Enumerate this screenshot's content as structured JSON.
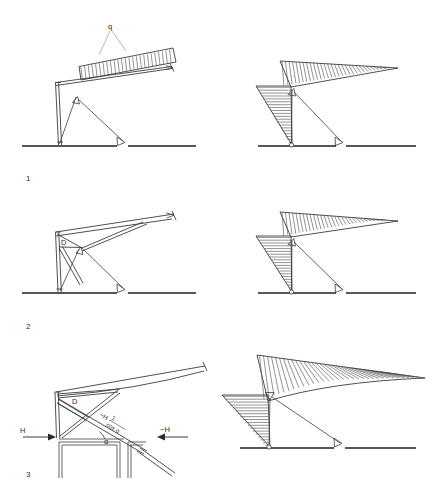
{
  "figure": {
    "rows": [
      {
        "number": "1",
        "left_caption": "Straight cantilever beam with uniform distributed load q, tension tie and diagonal strut",
        "right_caption": "Bending moment diagram with hatched areas"
      },
      {
        "number": "2",
        "left_caption": "Cantilever beam with diagonal member D, tie and strut",
        "right_caption": "Bending moment diagram with hatched areas"
      },
      {
        "number": "3",
        "left_caption": "Curved cantilever beam with crossed diagonals, horizontal forces H and -H, angle alpha",
        "right_caption": "Bending moment diagram with hatched areas"
      }
    ],
    "labels": {
      "load_q": "q",
      "diagonal_d": "D",
      "force_h": "H",
      "force_minus_h": "−H",
      "force_resultant": "−H ·",
      "resultant_num": "1",
      "resultant_den": "cos α",
      "angle_alpha": "α"
    },
    "colors": {
      "line": "#3c3c3c",
      "ground": "#1f1f1f",
      "hatch": "#4a4a4a",
      "leader": "#8a8a8a",
      "text": "#2b2b2b",
      "background": "#ffffff"
    }
  }
}
